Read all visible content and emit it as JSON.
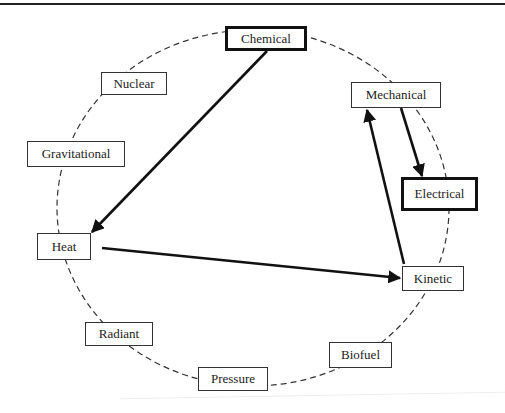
{
  "diagram": {
    "nodes": [
      {
        "id": "chemical",
        "label": "Chemical",
        "x": 225,
        "y": 26,
        "w": 82,
        "h": 25,
        "highlight": true
      },
      {
        "id": "nuclear",
        "label": "Nuclear",
        "x": 101,
        "y": 72,
        "w": 66,
        "h": 23,
        "highlight": false
      },
      {
        "id": "mechanical",
        "label": "Mechanical",
        "x": 351,
        "y": 82,
        "w": 90,
        "h": 26,
        "highlight": false
      },
      {
        "id": "gravitational",
        "label": "Gravitational",
        "x": 27,
        "y": 141,
        "w": 98,
        "h": 26,
        "highlight": false
      },
      {
        "id": "electrical",
        "label": "Electrical",
        "x": 401,
        "y": 177,
        "w": 77,
        "h": 34,
        "highlight": true
      },
      {
        "id": "heat",
        "label": "Heat",
        "x": 37,
        "y": 233,
        "w": 54,
        "h": 27,
        "highlight": false
      },
      {
        "id": "kinetic",
        "label": "Kinetic",
        "x": 402,
        "y": 266,
        "w": 62,
        "h": 25,
        "highlight": false
      },
      {
        "id": "radiant",
        "label": "Radiant",
        "x": 85,
        "y": 322,
        "w": 68,
        "h": 24,
        "highlight": false
      },
      {
        "id": "biofuel",
        "label": "Biofuel",
        "x": 329,
        "y": 342,
        "w": 63,
        "h": 26,
        "highlight": false
      },
      {
        "id": "pressure",
        "label": "Pressure",
        "x": 198,
        "y": 367,
        "w": 70,
        "h": 24,
        "highlight": false
      }
    ],
    "arrows": [
      {
        "from": "chemical",
        "to": "heat",
        "x1": 267,
        "y1": 51,
        "x2": 92,
        "y2": 232
      },
      {
        "from": "heat",
        "to": "kinetic",
        "x1": 102,
        "y1": 248,
        "x2": 400,
        "y2": 278
      },
      {
        "from": "kinetic",
        "to": "mechanical",
        "x1": 404,
        "y1": 264,
        "x2": 367,
        "y2": 110
      },
      {
        "from": "mechanical",
        "to": "electrical",
        "x1": 401,
        "y1": 108,
        "x2": 422,
        "y2": 176
      }
    ],
    "cycle": {
      "cx": 253,
      "cy": 208,
      "rx": 196,
      "ry": 178
    }
  }
}
